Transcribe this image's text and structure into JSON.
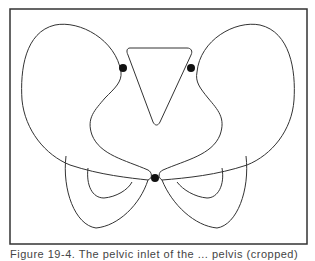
{
  "figure": {
    "frame": {
      "x": 10,
      "y": 9,
      "w": 297,
      "h": 235
    },
    "stroke_color": "#333333",
    "dot_color": "#111111",
    "left_wing_outline": "M 121 72 C 116 40, 80 20, 55 25 C 25 32, 20 70, 22 100 C 25 130, 45 155, 70 165 C 100 175, 130 178, 148 180 C 153 178, 152 172, 148 170 C 125 160, 100 155, 92 135 C 86 118, 95 110, 105 98 C 115 88, 122 82, 121 72 Z",
    "right_wing_outline": "M 197 72 C 200 40, 235 20, 260 25 C 290 32, 296 70, 294 100 C 292 130, 272 155, 247 165 C 217 175, 187 178, 162 180 C 158 178, 158 172, 163 170 C 186 160, 212 155, 220 135 C 226 118, 218 110, 208 98 C 200 88, 195 82, 197 72 Z",
    "left_lower_outer": "M 66 156 C 62 190, 75 225, 96 228 C 118 226, 140 205, 148 180",
    "left_lower_inner": "M 88 168 C 86 185, 92 198, 104 198 C 116 197, 128 190, 132 182",
    "right_lower_outer": "M 246 156 C 250 190, 237 225, 217 228 C 195 226, 172 205, 162 180",
    "right_lower_inner": "M 222 168 C 225 185, 218 198, 207 198 C 195 197, 183 190, 177 182",
    "center_triangle": "M 130 48 L 187 48 C 191 48, 193 51, 191 55 L 160 122 C 158 126, 155 126, 153 122 L 128 55 C 126 51, 127 48, 130 48 Z",
    "dots": [
      {
        "name": "left-landmark-dot",
        "cx": 123,
        "cy": 68,
        "r": 4
      },
      {
        "name": "right-landmark-dot",
        "cx": 191,
        "cy": 68,
        "r": 4
      },
      {
        "name": "center-landmark-dot",
        "cx": 155,
        "cy": 178,
        "r": 4
      }
    ]
  },
  "caption": {
    "text": "Figure 19-4. The pelvic inlet of the ... pelvis (cropped)"
  }
}
